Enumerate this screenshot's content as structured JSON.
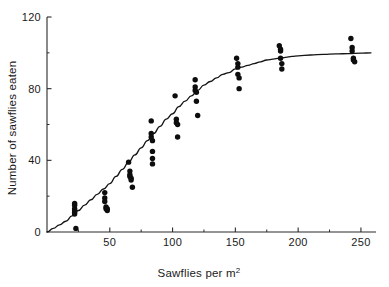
{
  "chart_data": {
    "type": "scatter",
    "title": "",
    "subtitle": "",
    "xlabel": "Sawflies per m",
    "xlabel_sup": "2",
    "xlabel_full": "Sawflies per m2",
    "ylabel": "Number of sawflies eaten",
    "xlim": [
      0,
      262
    ],
    "ylim": [
      0,
      120
    ],
    "xticks": [
      0,
      50,
      100,
      150,
      200,
      250
    ],
    "xtick_labels": [
      "0",
      "50",
      "100",
      "150",
      "200",
      "250"
    ],
    "xticks_minor": [
      25,
      75,
      125,
      175,
      225
    ],
    "yticks": [
      0,
      40,
      80,
      120
    ],
    "ytick_labels": [
      "0",
      "40",
      "80",
      "120"
    ],
    "yticks_minor": [
      20,
      60,
      100
    ],
    "grid": false,
    "legend": "none",
    "point_color": "#0d0d0d",
    "curve_color": "#141414",
    "axis_color": "#2a2a2a",
    "background": "#ffffff",
    "series": [
      {
        "name": "Observations",
        "marker": "filled-circle",
        "x": [
          22,
          22,
          22,
          22,
          22,
          22,
          23,
          46,
          46,
          46,
          47,
          47,
          48,
          48,
          65,
          66,
          66,
          66,
          67,
          67,
          68,
          83,
          83,
          83,
          84,
          84,
          84,
          84,
          102,
          103,
          103,
          104,
          104,
          118,
          118,
          118,
          119,
          119,
          120,
          151,
          152,
          152,
          152,
          153,
          153,
          185,
          186,
          186,
          186,
          187,
          187,
          242,
          243,
          243,
          244,
          244,
          245
        ],
        "y": [
          16,
          15,
          13,
          12,
          11,
          10,
          2,
          22,
          19,
          17,
          14,
          13,
          13,
          12,
          39,
          34,
          32,
          31,
          30,
          29,
          25,
          62,
          55,
          53,
          51,
          45,
          41,
          38,
          76,
          63,
          61,
          60,
          53,
          85,
          81,
          79,
          78,
          73,
          65,
          97,
          94,
          92,
          88,
          86,
          80,
          104,
          102,
          101,
          97,
          94,
          91,
          108,
          103,
          101,
          97,
          96,
          95
        ]
      }
    ],
    "fit_curve": {
      "name": "Fitted functional response",
      "x": [
        0,
        5,
        10,
        15,
        20,
        25,
        30,
        35,
        40,
        45,
        50,
        55,
        60,
        65,
        70,
        75,
        80,
        85,
        90,
        95,
        100,
        105,
        110,
        115,
        120,
        125,
        130,
        135,
        140,
        145,
        150,
        155,
        160,
        165,
        170,
        175,
        180,
        185,
        190,
        195,
        200,
        210,
        220,
        230,
        240,
        250,
        258
      ],
      "y": [
        0,
        2,
        4,
        6,
        9,
        12,
        15,
        18,
        21,
        24,
        27,
        31,
        35,
        39,
        43,
        47,
        51,
        55,
        59,
        63,
        66,
        70,
        73,
        76,
        79,
        82,
        84,
        86,
        88,
        89,
        91,
        92,
        93,
        94,
        95,
        96,
        96.5,
        97,
        97.5,
        98,
        98.3,
        98.8,
        99.1,
        99.4,
        99.6,
        99.8,
        100
      ]
    }
  }
}
